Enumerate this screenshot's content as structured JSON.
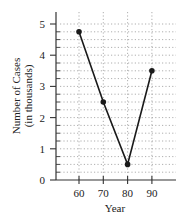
{
  "chart_data": {
    "type": "line",
    "title": "",
    "xlabel": "Year",
    "ylabel": "Number of Cases",
    "ylabel_sub": "(in thousands)",
    "categories": [
      "60",
      "70",
      "80",
      "90"
    ],
    "x": [
      60,
      70,
      80,
      90
    ],
    "values": [
      4.75,
      2.5,
      0.5,
      3.5
    ],
    "ylim": [
      0,
      5
    ],
    "yticks": [
      "0",
      "1",
      "2",
      "3",
      "4",
      "5"
    ],
    "xticks": [
      "60",
      "70",
      "80",
      "90"
    ],
    "grid": {
      "horizontal_step": 0.25,
      "vertical_at_x_ticks": true,
      "style": "dotted"
    },
    "marker": "filled-circle",
    "line_color": "#1a1a1a",
    "grid_color": "#9a9a9a"
  }
}
